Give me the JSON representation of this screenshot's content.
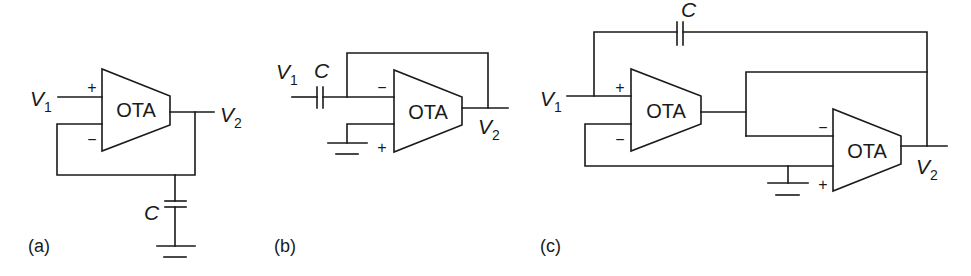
{
  "figure": {
    "panels": [
      {
        "id": "a",
        "caption": "(a)",
        "ota_label": "OTA",
        "plus_sign": "+",
        "minus_sign": "−",
        "input_label": "V",
        "input_sub": "1",
        "output_label": "V",
        "output_sub": "2",
        "capacitor_label": "C",
        "description": "OTA with V1 on + input, output V2 fed back to − input, capacitor C from output node to ground"
      },
      {
        "id": "b",
        "caption": "(b)",
        "ota_label": "OTA",
        "plus_sign": "+",
        "minus_sign": "−",
        "input_label": "V",
        "input_sub": "1",
        "output_label": "V",
        "output_sub": "2",
        "capacitor_label": "C",
        "description": "V1 through series capacitor C into − input, + input grounded, output V2 fed back to − input"
      },
      {
        "id": "c",
        "caption": "(c)",
        "ota1_label": "OTA",
        "ota2_label": "OTA",
        "plus_sign": "+",
        "minus_sign": "−",
        "input_label": "V",
        "input_sub": "1",
        "output_label": "V",
        "output_sub": "2",
        "capacitor_label": "C",
        "description": "Two-OTA circuit: capacitor C between V1 and V2, OTA1 output drives OTA2 − input and connects to V2, OTA2 + grounded"
      }
    ]
  }
}
